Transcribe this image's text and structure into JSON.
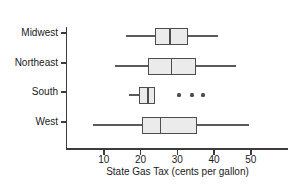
{
  "chart_data": {
    "type": "boxplot",
    "orientation": "horizontal",
    "title": "",
    "xlabel": "State Gas Tax (cents per gallon)",
    "ylabel": "",
    "x_ticks": [
      10,
      20,
      30,
      40,
      50
    ],
    "xlim": [
      0,
      60
    ],
    "grid": false,
    "categories": [
      "Midwest",
      "Northeast",
      "South",
      "West"
    ],
    "series": [
      {
        "name": "Midwest",
        "whisker_low": 16,
        "q1": 24,
        "median": 28,
        "q3": 33,
        "whisker_high": 41,
        "outliers": []
      },
      {
        "name": "Northeast",
        "whisker_low": 13,
        "q1": 22,
        "median": 28.5,
        "q3": 35,
        "whisker_high": 46,
        "outliers": []
      },
      {
        "name": "South",
        "whisker_low": 17,
        "q1": 19.5,
        "median": 22,
        "q3": 24,
        "whisker_high": 24,
        "outliers": [
          30.5,
          34,
          37
        ]
      },
      {
        "name": "West",
        "whisker_low": 7,
        "q1": 20.5,
        "median": 25.5,
        "q3": 35.5,
        "whisker_high": 49.5,
        "outliers": []
      }
    ],
    "colors": {
      "box_fill": "#ebebeb",
      "box_border": "#4d4d4d",
      "whisker": "#5a5a5a",
      "outlier": "#4d4d4d",
      "axis": "#3c3c3c",
      "text": "#1a1a1a"
    }
  }
}
